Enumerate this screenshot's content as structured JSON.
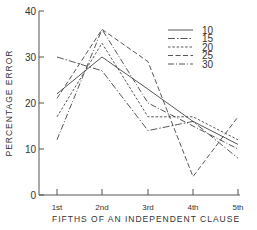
{
  "chart_data": {
    "type": "line",
    "title": "",
    "xlabel": "FIFTHS OF AN INDEPENDENT CLAUSE",
    "ylabel": "PERCENTAGE ERROR",
    "categories": [
      "1st",
      "2nd",
      "3rd",
      "4th",
      "5th"
    ],
    "ylim": [
      0,
      40
    ],
    "yticks": [
      0,
      10,
      20,
      30,
      40
    ],
    "grid": false,
    "legend_position": "upper right",
    "series": [
      {
        "name": "10",
        "style": "solid",
        "values": [
          22,
          30,
          23,
          16,
          11
        ]
      },
      {
        "name": "15",
        "style": "dash-dot-fine",
        "values": [
          30,
          27,
          14,
          16,
          8
        ]
      },
      {
        "name": "20",
        "style": "short-dash",
        "values": [
          17,
          33,
          17,
          17,
          12
        ]
      },
      {
        "name": "25",
        "style": "long-dash",
        "values": [
          21,
          36,
          29,
          4,
          17
        ]
      },
      {
        "name": "30",
        "style": "dash-dot",
        "values": [
          12,
          36,
          20,
          15,
          10
        ]
      }
    ]
  },
  "colors": {
    "line": "#444444",
    "axis": "#555555",
    "background": "#ffffff"
  }
}
